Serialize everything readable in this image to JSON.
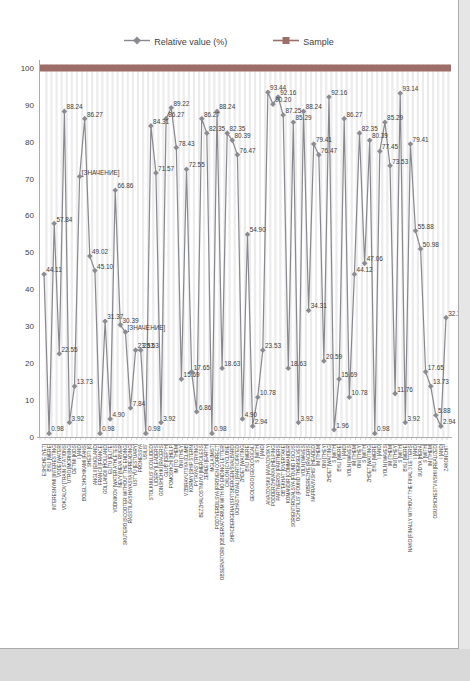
{
  "legend": {
    "series1_label": "Relative value (%)",
    "series2_label": "Sample"
  },
  "colors": {
    "series_relative": "#8b8b92",
    "series_relative_line": "#88888f",
    "series_sample": "#9d6e68",
    "label_text": "#3f3f3f",
    "data_label_text": "#404040",
    "grid": "#ececec",
    "axis": "#ababab",
    "page_background": "#d9d9d9"
  },
  "chart_data": {
    "type": "line",
    "title": "",
    "legend_position": "top",
    "grid": "vertical-stripes",
    "ylim": [
      0,
      100
    ],
    "yticks": [
      0,
      10,
      20,
      30,
      40,
      50,
      60,
      70,
      80,
      90,
      100
    ],
    "x_labels_rotation": -90,
    "categories": [
      "ESHCHE [YET]",
      "BYLI [WERE]",
      "INTERESNYMI [INTERESTING]",
      "VODE [WATER]",
      "VOKZALOV [TRAIN STATIONS]",
      "UTRO [MORNING]",
      "DET'MI [KIDS]",
      "I [AND]",
      "BOLEL'SHCHIKAMI [FANS]",
      "SHESTI [6]",
      "ANGLII [ENGLAND]",
      "FRANCII [FRANCE]",
      "GOLLANDII [HOLLAND]",
      "ELITU [ELITE]",
      "VODNIKOV [WATER ATHLETES]",
      "NEVY [NEVA RIVER]",
      "SKUTERO [SCOOTER WITHOUT THE ENDING]",
      "RASSTILAVSHAYASYA [SPREADING]",
      "UST'YU [ESTUARY]",
      "PRONESSYA",
      "USILIS'",
      "STOLKNULIS' [COLLIDED]",
      "LIDERY [LEADERS]",
      "GONSHCHIKI [RACERS]",
      "GLUB' [DEPTH]",
      "POMOSHCHI [HELP]",
      "IM [TO THEM]",
      "ONI [THEY]",
      "VZBIRAYUTSYA [CLIMB]",
      "KORMY [SHIP STERN]",
      "PYTAYAS' [TRYING]",
      "BEZZHALOSTNUYU [MERCILESS]",
      "ZEMLEI [EARTH]",
      "MGLA [MIST]",
      "PODTVERDILSYA [PROVEN CORRECT]",
      "OBSERVATORII [OBSERVATORIUM WITH NO ENDING LETTER]",
      "CIKLON [CYCLONE]",
      "SHPICBERGENA [SPITSBERGEN/SVALBARD]",
      "UCHASTVOVALI [PARTICIPATED]",
      "ZHDET [WAITING]",
      "BYLI [WERE]",
      "GEOLOGO [GEOLOGICAL]",
      "S [WITH]",
      "I [AND]",
      "AIVAZOVSKII [AIVAZOVSKY]",
      "PODDERZHIVAYA [HELPING]",
      "PARTNEROV [PARTNERS]",
      "OB\"EKHAT' [OVERTAKE]",
      "KOMANDIR [COMMANDER]",
      "SORIENTIROVALSYA [FOUND FOCUS]",
      "OCHUTILIS' [FOUND THEMSELVES]",
      "VOLN [WAVES]",
      "POBEREZH'E [RACERS]",
      "NAPRAVIVSHIS' [HEADED]",
      "IM [THEM]",
      "ONI [THEY]",
      "ZHDET [WAITING]",
      "S [WITH]",
      "BYLI [WERE]",
      "I [AND]",
      "VOLN [WAVES]",
      "IM [THEM]",
      "ONI [THEY]",
      "S [WITH]",
      "ZHDET [WAITING]",
      "BYLI [WERE]",
      "I [AND]",
      "VOLN [WAVES]",
      "IM [THEM]",
      "ONI [THEY]",
      "S [WITH]",
      "BYLI [WERE]",
      "NAKO [FINALLY WITHOUT THE FINAL 3 LETTERS]",
      "I [AND]",
      "SUD'YA [HERA]",
      "S [WITH]",
      "IM [THEM]",
      "OSUSHCHESTVIVSHII [REALIZED]",
      "I [AND]",
      "ZAKONCHIT'"
    ],
    "series": [
      {
        "name": "Relative value (%)",
        "marker": "diamond",
        "values": [
          44.11,
          0.98,
          57.84,
          22.55,
          88.24,
          3.92,
          13.73,
          70.59,
          86.27,
          49.02,
          45.1,
          0.98,
          31.37,
          4.9,
          66.86,
          30.39,
          28.43,
          7.84,
          23.53,
          23.53,
          0.98,
          84.31,
          71.57,
          3.92,
          86.27,
          89.22,
          78.43,
          15.69,
          72.55,
          17.65,
          6.86,
          86.27,
          82.35,
          0.98,
          88.24,
          18.63,
          82.35,
          80.39,
          76.47,
          4.9,
          54.9,
          2.94,
          10.78,
          23.53,
          93.44,
          90.2,
          92.16,
          87.25,
          18.63,
          85.29,
          3.92,
          88.24,
          34.31,
          79.41,
          76.47,
          20.59,
          92.16,
          1.96,
          15.69,
          86.27,
          10.78,
          44.12,
          82.35,
          47.06,
          80.39,
          0.98,
          77.45,
          85.29,
          73.53,
          11.76,
          93.14,
          3.92,
          79.41,
          55.88,
          50.98,
          17.65,
          13.73,
          5.88,
          2.94,
          32.35
        ]
      },
      {
        "name": "Sample",
        "marker": "square",
        "constant_value": 100
      }
    ],
    "value_label_placeholders": {
      "7": "[ЗНАЧЕНИЕ]",
      "16": "[ЗНАЧЕНИЕ]"
    }
  }
}
